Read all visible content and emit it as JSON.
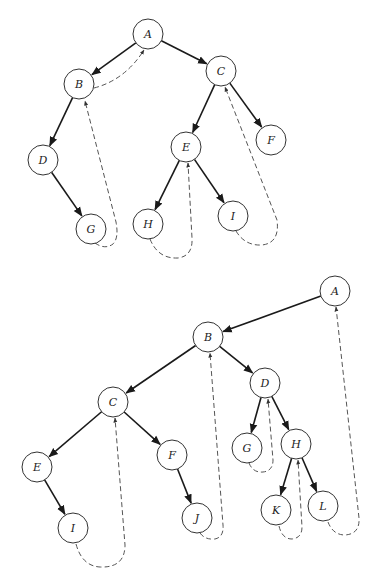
{
  "diagrams": [
    {
      "id": "top",
      "description": "Threaded binary tree (upper)",
      "nodes": [
        {
          "label": "A",
          "x": 148,
          "y": 34
        },
        {
          "label": "B",
          "x": 79,
          "y": 84
        },
        {
          "label": "C",
          "x": 221,
          "y": 71
        },
        {
          "label": "D",
          "x": 43,
          "y": 160
        },
        {
          "label": "E",
          "x": 186,
          "y": 147
        },
        {
          "label": "F",
          "x": 271,
          "y": 140
        },
        {
          "label": "G",
          "x": 91,
          "y": 229
        },
        {
          "label": "H",
          "x": 148,
          "y": 224
        },
        {
          "label": "I",
          "x": 233,
          "y": 216
        }
      ],
      "edges": [
        {
          "from": "A",
          "to": "B"
        },
        {
          "from": "A",
          "to": "C"
        },
        {
          "from": "B",
          "to": "D"
        },
        {
          "from": "D",
          "to": "G"
        },
        {
          "from": "C",
          "to": "E"
        },
        {
          "from": "C",
          "to": "F"
        },
        {
          "from": "E",
          "to": "H"
        },
        {
          "from": "E",
          "to": "I"
        }
      ],
      "threads": [
        {
          "from": "B",
          "to": "A",
          "path": "M 94 88 Q 125 80 144 50"
        },
        {
          "from": "G",
          "to": "B",
          "path": "M 95 243 Q 105 250 113 244 Q 119 238 116 222 L 85 101"
        },
        {
          "from": "H",
          "to": "E",
          "path": "M 150 239 Q 158 259 178 258 Q 193 256 192 238 L 188 163"
        },
        {
          "from": "I",
          "to": "C",
          "path": "M 236 231 Q 245 246 262 245 Q 280 243 277 220 L 225 87"
        }
      ]
    },
    {
      "id": "bottom",
      "description": "Threaded binary tree (lower)",
      "nodes": [
        {
          "label": "A",
          "x": 335,
          "y": 291
        },
        {
          "label": "B",
          "x": 208,
          "y": 337
        },
        {
          "label": "C",
          "x": 113,
          "y": 402
        },
        {
          "label": "D",
          "x": 265,
          "y": 383
        },
        {
          "label": "E",
          "x": 37,
          "y": 467
        },
        {
          "label": "F",
          "x": 172,
          "y": 455
        },
        {
          "label": "G",
          "x": 247,
          "y": 448
        },
        {
          "label": "H",
          "x": 296,
          "y": 444
        },
        {
          "label": "I",
          "x": 73,
          "y": 528
        },
        {
          "label": "J",
          "x": 197,
          "y": 518
        },
        {
          "label": "K",
          "x": 276,
          "y": 510
        },
        {
          "label": "L",
          "x": 323,
          "y": 506
        }
      ],
      "edges": [
        {
          "from": "A",
          "to": "B"
        },
        {
          "from": "B",
          "to": "C"
        },
        {
          "from": "B",
          "to": "D"
        },
        {
          "from": "C",
          "to": "E"
        },
        {
          "from": "C",
          "to": "F"
        },
        {
          "from": "D",
          "to": "G"
        },
        {
          "from": "D",
          "to": "H"
        },
        {
          "from": "E",
          "to": "I"
        },
        {
          "from": "F",
          "to": "J"
        },
        {
          "from": "H",
          "to": "K"
        },
        {
          "from": "H",
          "to": "L"
        }
      ],
      "threads": [
        {
          "from": "I",
          "to": "C",
          "path": "M 76 544 Q 82 566 100 567 Q 125 568 125 545 L 115 418"
        },
        {
          "from": "J",
          "to": "B",
          "path": "M 200 533 Q 205 540 215 539 Q 224 537 223 525 L 210 353"
        },
        {
          "from": "G",
          "to": "D",
          "path": "M 249 463 Q 253 473 263 472 Q 273 471 273 460 L 268 399"
        },
        {
          "from": "K",
          "to": "H",
          "path": "M 279 526 Q 282 539 292 539 Q 302 538 302 527 L 298 460"
        },
        {
          "from": "L",
          "to": "A",
          "path": "M 328 522 Q 333 535 345 535 Q 360 534 359 518 L 336 307"
        }
      ]
    }
  ],
  "style": {
    "node_radius": 15,
    "edge_color": "#1a1a1a",
    "thread_color": "#555555",
    "background": "#ffffff"
  }
}
